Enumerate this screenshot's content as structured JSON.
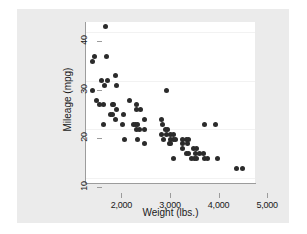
{
  "chart_data": {
    "type": "scatter",
    "title": "",
    "xlabel": "Weight (lbs.)",
    "ylabel": "Mileage (mpg)",
    "xlim": [
      1600,
      5100
    ],
    "ylim": [
      9,
      42
    ],
    "xticks": [
      2000,
      3000,
      4000,
      5000
    ],
    "xtick_labels": [
      "2,000",
      "3,000",
      "4,000",
      "5,000"
    ],
    "yticks": [
      10,
      20,
      30,
      40
    ],
    "ytick_labels": [
      "10",
      "20",
      "30",
      "40"
    ],
    "grid": "horizontal",
    "legend": "none",
    "marker_color": "#2b2b2b",
    "panel_color": "#ffffff",
    "background_color": "#ebebeb",
    "series": [
      {
        "name": "mileage vs weight",
        "points": [
          [
            2020,
            41
          ],
          [
            1800,
            35
          ],
          [
            2050,
            35
          ],
          [
            1760,
            34
          ],
          [
            2230,
            31
          ],
          [
            1930,
            30
          ],
          [
            2070,
            30
          ],
          [
            2010,
            29
          ],
          [
            2240,
            29
          ],
          [
            1760,
            28
          ],
          [
            3280,
            28
          ],
          [
            1830,
            26
          ],
          [
            2520,
            26
          ],
          [
            1900,
            25
          ],
          [
            1980,
            25
          ],
          [
            2160,
            25
          ],
          [
            2190,
            25
          ],
          [
            2650,
            25
          ],
          [
            2240,
            24
          ],
          [
            2670,
            24
          ],
          [
            2750,
            24
          ],
          [
            2130,
            23
          ],
          [
            2160,
            23
          ],
          [
            2400,
            23
          ],
          [
            2230,
            22
          ],
          [
            2830,
            22
          ],
          [
            3170,
            22
          ],
          [
            2370,
            21
          ],
          [
            2600,
            21
          ],
          [
            2640,
            21
          ],
          [
            2690,
            21
          ],
          [
            3190,
            21
          ],
          [
            4060,
            21
          ],
          [
            4290,
            21
          ],
          [
            1980,
            21
          ],
          [
            2650,
            20
          ],
          [
            2730,
            20
          ],
          [
            2830,
            20
          ],
          [
            3250,
            20
          ],
          [
            3300,
            20
          ],
          [
            3280,
            19
          ],
          [
            3350,
            19
          ],
          [
            3420,
            19
          ],
          [
            3170,
            19
          ],
          [
            2410,
            18
          ],
          [
            2690,
            18
          ],
          [
            3220,
            18
          ],
          [
            3360,
            18
          ],
          [
            3430,
            18
          ],
          [
            3470,
            18
          ],
          [
            3600,
            18
          ],
          [
            3690,
            18
          ],
          [
            3740,
            18
          ],
          [
            2830,
            17
          ],
          [
            3330,
            17
          ],
          [
            3370,
            17
          ],
          [
            3600,
            17
          ],
          [
            3720,
            17
          ],
          [
            3830,
            16
          ],
          [
            3900,
            16
          ],
          [
            3600,
            16
          ],
          [
            3690,
            15
          ],
          [
            3740,
            15
          ],
          [
            3880,
            15
          ],
          [
            3960,
            15
          ],
          [
            4030,
            15
          ],
          [
            3420,
            14
          ],
          [
            3800,
            14
          ],
          [
            3850,
            14
          ],
          [
            3900,
            14
          ],
          [
            4060,
            14
          ],
          [
            4130,
            14
          ],
          [
            4330,
            14
          ],
          [
            4720,
            12
          ],
          [
            4840,
            12
          ]
        ]
      }
    ]
  },
  "axes": {
    "y_title": "Mileage (mpg)",
    "x_title": "Weight (lbs.)"
  }
}
